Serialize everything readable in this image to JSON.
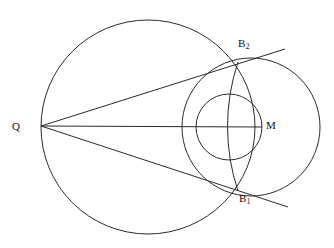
{
  "figure": {
    "kind": "geometry-diagram",
    "title": "",
    "background_color": "#ffffff",
    "stroke_color": "#2b2b2b",
    "label_color": "#101010",
    "width": 334,
    "height": 248
  },
  "labels": [
    {
      "id": "Q",
      "base": "Q",
      "sub": "",
      "x": 12,
      "y": 121
    },
    {
      "id": "M",
      "base": "M",
      "sub": "",
      "x": 266,
      "y": 120
    },
    {
      "id": "B2",
      "base": "B",
      "sub": "2",
      "x": 238,
      "y": 38
    },
    {
      "id": "B1",
      "base": "B",
      "sub": "1",
      "x": 239,
      "y": 193
    }
  ],
  "points": {
    "Q": {
      "label": "Q",
      "x": 41,
      "y": 126
    },
    "M": {
      "label": "M",
      "x": 262,
      "y": 127
    },
    "B2": {
      "label": "B2",
      "x": 238,
      "y": 62
    },
    "B1": {
      "label": "B1",
      "x": 238,
      "y": 191
    }
  },
  "circles": [
    {
      "name": "large-circle",
      "cx": 148,
      "cy": 127,
      "r": 107
    },
    {
      "name": "middle-circle",
      "cx": 229,
      "cy": 127,
      "r": 33
    },
    {
      "name": "right-circle",
      "cx": 251,
      "cy": 127,
      "r": 69
    }
  ],
  "arcs": [
    {
      "name": "arc-through-B1-B2",
      "center_label": "Q",
      "cx": 41,
      "cy": 126,
      "r": 204,
      "from_x": 238,
      "from_y": 62,
      "to_x": 238,
      "to_y": 191
    }
  ],
  "lines": [
    {
      "name": "line-Q-to-B2-tangent",
      "x1": 41,
      "y1": 126,
      "x2": 285,
      "y2": 49
    },
    {
      "name": "line-Q-to-M",
      "x1": 41,
      "y1": 126,
      "x2": 262,
      "y2": 127
    },
    {
      "name": "line-Q-to-B1-tangent",
      "x1": 41,
      "y1": 126,
      "x2": 288,
      "y2": 207
    }
  ]
}
